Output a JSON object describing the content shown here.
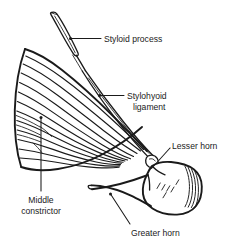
{
  "figure": {
    "background_color": "#ffffff",
    "ink_color": "#1a1a1a",
    "width": 240,
    "height": 252,
    "style": "black and white anatomical line drawing"
  },
  "labels": {
    "styloid_process": "Styloid process",
    "stylohyoid_ligament_line1": "Stylohyoid",
    "stylohyoid_ligament_line2": "ligament",
    "lesser_horn": "Lesser horn",
    "middle_constrictor_line1": "Middle",
    "middle_constrictor_line2": "constrictor",
    "greater_horn": "Greater horn"
  },
  "structures": [
    {
      "name": "styloid-process",
      "label": "Styloid process",
      "description": "narrow tapering bone spine at upper left angling down and to the right"
    },
    {
      "name": "stylohyoid-ligament",
      "label": "Stylohyoid ligament",
      "description": "narrow band running diagonally from styloid process tip to the lesser horn"
    },
    {
      "name": "middle-constrictor",
      "label": "Middle constrictor",
      "description": "fan of curved parallel muscle fibers from a vertical midline raphe converging to the right"
    },
    {
      "name": "lesser-horn",
      "label": "Lesser horn",
      "description": "small projection at the junction of ligament and hyoid bone"
    },
    {
      "name": "greater-horn",
      "label": "Greater horn",
      "description": "long process extending to the left from the hyoid body"
    },
    {
      "name": "hyoid-body",
      "label": "Hyoid body",
      "description": "rounded block at lower right with hatch marks and vertical ridges on its right edge"
    }
  ]
}
